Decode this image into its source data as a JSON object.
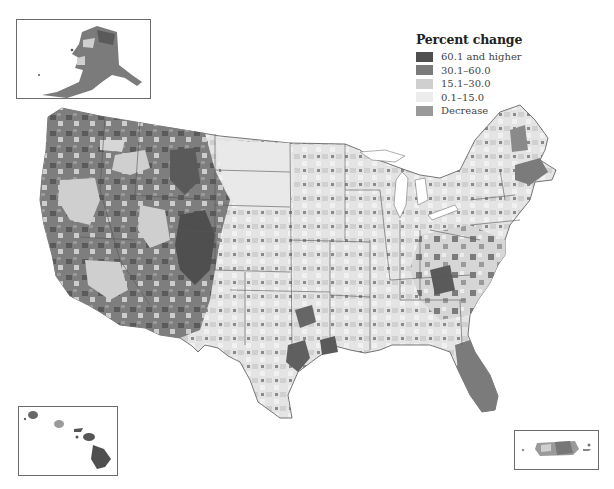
{
  "legend": {
    "title": "Percent change",
    "items": [
      {
        "label": "60.1 and higher",
        "color": "#4f4f4f"
      },
      {
        "label": "30.1–60.0",
        "color": "#7b7b7b"
      },
      {
        "label": "15.1–30.0",
        "color": "#cfcfcf"
      },
      {
        "label": "0.1–15.0",
        "color": "#ececec"
      },
      {
        "label": "Decrease",
        "color": "#9a9a9a"
      }
    ]
  },
  "insets": [
    {
      "name": "Alaska"
    },
    {
      "name": "Hawaii"
    },
    {
      "name": "Puerto Rico"
    }
  ],
  "map": {
    "subject": "United States counties, percent change",
    "style": "grayscale choropleth"
  }
}
